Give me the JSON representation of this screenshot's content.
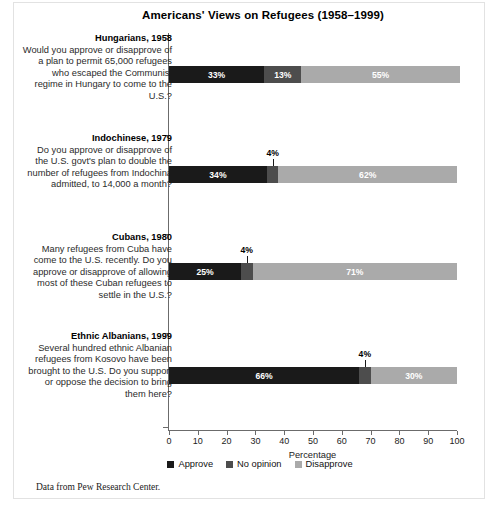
{
  "chart_data": {
    "type": "bar",
    "orientation": "horizontal",
    "stacked": true,
    "title": "Americans' Views on Refugees (1958–1999)",
    "xlabel": "Percentage",
    "ylabel": "",
    "xlim": [
      0,
      100
    ],
    "xticks": [
      0,
      10,
      20,
      30,
      40,
      50,
      60,
      70,
      80,
      90,
      100
    ],
    "grid": false,
    "legend_position": "bottom",
    "legend": [
      "Approve",
      "No opinion",
      "Disapprove"
    ],
    "series": [
      {
        "name": "Approve",
        "color": "#1a1a1a",
        "values": [
          33,
          34,
          25,
          66
        ]
      },
      {
        "name": "No opinion",
        "color": "#4d4d4d",
        "values": [
          13,
          4,
          4,
          4
        ]
      },
      {
        "name": "Disapprove",
        "color": "#aaaaaa",
        "values": [
          55,
          62,
          71,
          30
        ]
      }
    ],
    "categories": [
      "Hungarians, 1958",
      "Indochinese, 1979",
      "Cubans, 1980",
      "Ethnic Albanians, 1999"
    ],
    "groups": [
      {
        "heading": "Hungarians, 1958",
        "question": "Would you approve or disapprove of a plan to permit 65,000 refugees who escaped the Communist regime in Hungary to come to the U.S.?",
        "approve": "33%",
        "no_opinion": "13%",
        "disapprove": "55%",
        "no_opinion_callout": false
      },
      {
        "heading": "Indochinese, 1979",
        "question": "Do you approve or disapprove of the U.S. govt's plan to double the number of refugees from Indochina admitted, to 14,000 a month?",
        "approve": "34%",
        "no_opinion": "4%",
        "disapprove": "62%",
        "no_opinion_callout": true
      },
      {
        "heading": "Cubans, 1980",
        "question": "Many refugees from Cuba have come to the U.S. recently. Do you approve or disapprove of allowing most of these Cuban refugees to settle in the U.S.?",
        "approve": "25%",
        "no_opinion": "4%",
        "disapprove": "71%",
        "no_opinion_callout": true
      },
      {
        "heading": "Ethnic Albanians, 1999",
        "question": "Several hundred ethnic Albanian refugees from Kosovo have been brought to the U.S. Do you support or oppose the decision to bring them here?",
        "approve": "66%",
        "no_opinion": "4%",
        "disapprove": "30%",
        "no_opinion_callout": true
      }
    ]
  },
  "footer": {
    "source": "Data from Pew Research Center."
  }
}
